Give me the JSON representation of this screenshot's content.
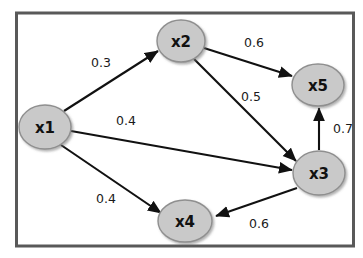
{
  "diagram": {
    "frame": {
      "border_color": "#595959",
      "background_color": "#ffffff"
    },
    "node_style": {
      "fill": "#c9c9c9",
      "stroke": "#8f8f8f",
      "text_color": "#111111"
    },
    "edge_style": {
      "stroke": "#111111",
      "label_color": "#1a1a1a"
    },
    "nodes": [
      {
        "id": "x1",
        "label": "x1",
        "cx": 45,
        "cy": 127,
        "rx": 26,
        "ry": 22
      },
      {
        "id": "x2",
        "label": "x2",
        "cx": 181,
        "cy": 41,
        "rx": 24,
        "ry": 21
      },
      {
        "id": "x3",
        "label": "x3",
        "cx": 319,
        "cy": 173,
        "rx": 26,
        "ry": 22
      },
      {
        "id": "x4",
        "label": "x4",
        "cx": 185,
        "cy": 221,
        "rx": 27,
        "ry": 21
      },
      {
        "id": "x5",
        "label": "x5",
        "cx": 318,
        "cy": 85,
        "rx": 26,
        "ry": 21
      }
    ],
    "edges": [
      {
        "from": "x1",
        "to": "x2",
        "weight": "0.3",
        "label_x": 101,
        "label_y": 62
      },
      {
        "from": "x2",
        "to": "x5",
        "weight": "0.6",
        "label_x": 254,
        "label_y": 42
      },
      {
        "from": "x2",
        "to": "x3",
        "weight": "0.5",
        "label_x": 251,
        "label_y": 96
      },
      {
        "from": "x1",
        "to": "x3",
        "weight": "0.4",
        "label_x": 126,
        "label_y": 120
      },
      {
        "from": "x3",
        "to": "x5",
        "weight": "0.7",
        "label_x": 343,
        "label_y": 128
      },
      {
        "from": "x1",
        "to": "x4",
        "weight": "0.4",
        "label_x": 106,
        "label_y": 198
      },
      {
        "from": "x3",
        "to": "x4",
        "weight": "0.6",
        "label_x": 259,
        "label_y": 223
      }
    ]
  }
}
